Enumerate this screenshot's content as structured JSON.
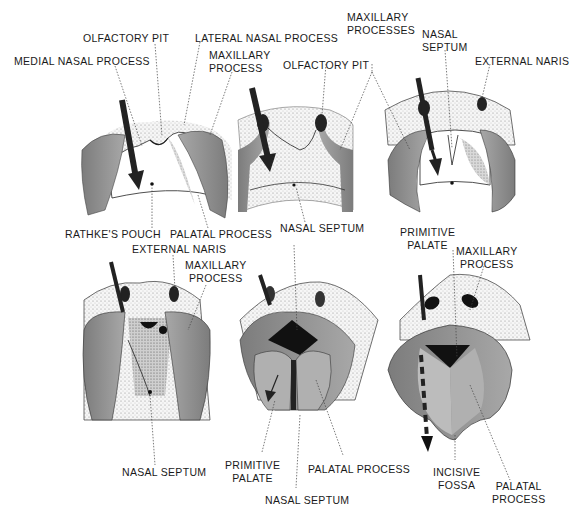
{
  "figure": {
    "colors": {
      "process_fill": "#8e8e8e",
      "process_light": "#b4b4b4",
      "stipple": "#d8d8d8",
      "dark": "#111111",
      "leader_line": "#444444"
    },
    "panels": [
      {
        "id": "stage-1",
        "labels": [
          "OLFACTORY PIT",
          "MEDIAL NASAL PROCESS",
          "LATERAL NASAL PROCESS",
          "MAXILLARY PROCESS",
          "RATHKE'S POUCH",
          "PALATAL PROCESS"
        ]
      },
      {
        "id": "stage-2",
        "labels": [
          "OLFACTORY PIT",
          "MAXILLARY PROCESSES",
          "NASAL SEPTUM"
        ]
      },
      {
        "id": "stage-3",
        "labels": [
          "NASAL SEPTUM",
          "EXTERNAL NARIS",
          "PRIMITIVE PALATE"
        ]
      },
      {
        "id": "stage-4",
        "labels": [
          "EXTERNAL NARIS",
          "MAXILLARY PROCESS",
          "NASAL SEPTUM"
        ]
      },
      {
        "id": "stage-5",
        "labels": [
          "PRIMITIVE PALATE",
          "PALATAL PROCESS",
          "NASAL SEPTUM"
        ]
      },
      {
        "id": "stage-6",
        "labels": [
          "MAXILLARY PROCESS",
          "INCISIVE FOSSA",
          "PALATAL PROCESS"
        ]
      }
    ]
  },
  "labels": {
    "olfactory_pit_1": "OLFACTORY PIT",
    "lateral_nasal_process": "LATERAL NASAL PROCESS",
    "medial_nasal_process": "MEDIAL NASAL PROCESS",
    "maxillary_process_1": [
      "MAXILLARY",
      "PROCESS"
    ],
    "olfactory_pit_2": "OLFACTORY PIT",
    "maxillary_processes": [
      "MAXILLARY",
      "PROCESSES"
    ],
    "nasal_septum_top": [
      "NASAL",
      "SEPTUM"
    ],
    "external_naris_top": "EXTERNAL NARIS",
    "rathkes_pouch": "RATHKE'S POUCH",
    "palatal_process_1": "PALATAL PROCESS",
    "nasal_septum_2": "NASAL SEPTUM",
    "external_naris_bottom": "EXTERNAL NARIS",
    "maxillary_process_4": [
      "MAXILLARY",
      "PROCESS"
    ],
    "primitive_palate_3": [
      "PRIMITIVE",
      "PALATE"
    ],
    "maxillary_process_6": [
      "MAXILLARY",
      "PROCESS"
    ],
    "nasal_septum_4": "NASAL SEPTUM",
    "primitive_palate_5": [
      "PRIMITIVE",
      "PALATE"
    ],
    "palatal_process_5": "PALATAL PROCESS",
    "nasal_septum_5": "NASAL SEPTUM",
    "incisive_fossa": [
      "INCISIVE",
      "FOSSA"
    ],
    "palatal_process_6": [
      "PALATAL",
      "PROCESS"
    ]
  }
}
